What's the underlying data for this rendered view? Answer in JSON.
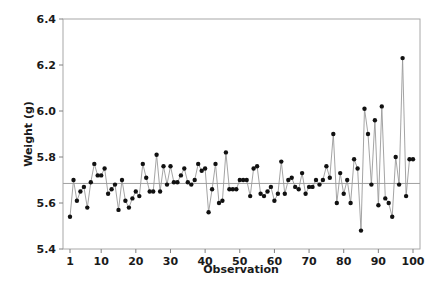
{
  "chart_data": {
    "type": "line",
    "title": "",
    "xlabel": "Observation",
    "ylabel": "Weight (g)",
    "xlim": [
      0,
      101.5
    ],
    "ylim": [
      5.4,
      6.4
    ],
    "x_ticks": [
      1,
      10,
      20,
      30,
      40,
      50,
      60,
      70,
      80,
      90,
      100
    ],
    "y_ticks": [
      5.4,
      5.6,
      5.8,
      6.0,
      6.2,
      6.4
    ],
    "y_tick_labels": [
      "5.4",
      "5.6",
      "5.8",
      "6.0",
      "6.2",
      "6.4"
    ],
    "x_tick_labels": [
      "1",
      "10",
      "20",
      "30",
      "40",
      "50",
      "60",
      "70",
      "80",
      "90",
      "100"
    ],
    "grid": false,
    "legend": null,
    "reference_line": {
      "label": "mean",
      "value": 5.685
    },
    "markers": "filled-circle",
    "colors": {
      "line": "#9a9a9a",
      "marker": "#111111",
      "reference_line": "#a0a0a0",
      "frame": "#a8a8a8"
    },
    "series": [
      {
        "name": "Weight (g)",
        "x": [
          1,
          2,
          3,
          4,
          5,
          6,
          7,
          8,
          9,
          10,
          11,
          12,
          13,
          14,
          15,
          16,
          17,
          18,
          19,
          20,
          21,
          22,
          23,
          24,
          25,
          26,
          27,
          28,
          29,
          30,
          31,
          32,
          33,
          34,
          35,
          36,
          37,
          38,
          39,
          40,
          41,
          42,
          43,
          44,
          45,
          46,
          47,
          48,
          49,
          50,
          51,
          52,
          53,
          54,
          55,
          56,
          57,
          58,
          59,
          60,
          61,
          62,
          63,
          64,
          65,
          66,
          67,
          68,
          69,
          70,
          71,
          72,
          73,
          74,
          75,
          76,
          77,
          78,
          79,
          80,
          81,
          82,
          83,
          84,
          85,
          86,
          87,
          88,
          89,
          90,
          91,
          92,
          93,
          94,
          95,
          96,
          97,
          98,
          99,
          100
        ],
        "values": [
          5.54,
          5.7,
          5.61,
          5.65,
          5.67,
          5.58,
          5.69,
          5.77,
          5.72,
          5.72,
          5.75,
          5.64,
          5.66,
          5.68,
          5.57,
          5.7,
          5.61,
          5.58,
          5.62,
          5.65,
          5.63,
          5.77,
          5.71,
          5.65,
          5.65,
          5.81,
          5.65,
          5.76,
          5.68,
          5.76,
          5.69,
          5.69,
          5.72,
          5.75,
          5.69,
          5.68,
          5.7,
          5.77,
          5.74,
          5.75,
          5.56,
          5.66,
          5.77,
          5.6,
          5.61,
          5.82,
          5.66,
          5.66,
          5.66,
          5.7,
          5.7,
          5.7,
          5.63,
          5.75,
          5.76,
          5.64,
          5.63,
          5.65,
          5.67,
          5.61,
          5.64,
          5.78,
          5.64,
          5.7,
          5.71,
          5.67,
          5.66,
          5.73,
          5.64,
          5.67,
          5.67,
          5.7,
          5.68,
          5.7,
          5.76,
          5.71,
          5.9,
          5.6,
          5.73,
          5.64,
          5.7,
          5.6,
          5.79,
          5.75,
          5.48,
          6.01,
          5.9,
          5.68,
          5.96,
          5.59,
          6.02,
          5.62,
          5.6,
          5.54,
          5.8,
          5.68,
          6.23,
          5.63,
          5.79,
          5.79
        ]
      }
    ]
  }
}
